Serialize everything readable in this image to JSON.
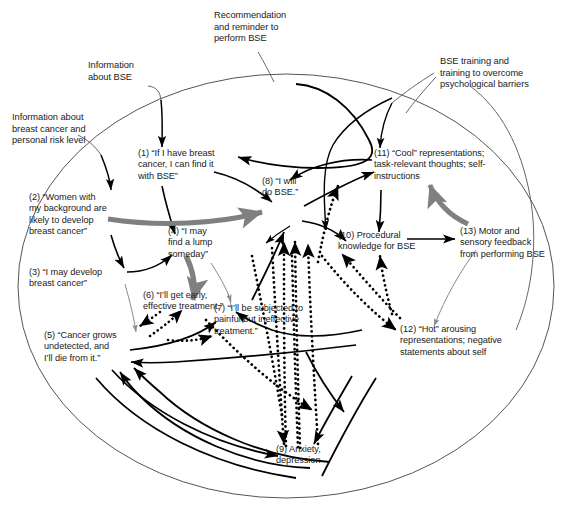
{
  "figure": {
    "boundary_shape": "ellipse",
    "colors": {
      "text": "#1a1a1a",
      "solid_arrow": "#000000",
      "dotted_arrow": "#000000",
      "gray_arrow": "#808080",
      "thin_gray_arrow": "#8a8a8a",
      "boundary": "#555555",
      "background": "#ffffff"
    },
    "legend_note": "Solid black arrows, thick gray arrows, thin gray arrows, and dotted black arrows denote different link types"
  },
  "external_inputs": [
    {
      "id": "ext-information-about-bse",
      "text": "Information\nabout BSE"
    },
    {
      "id": "ext-recommendation-reminder",
      "text": "Recommendation\nand reminder to\nperform BSE"
    },
    {
      "id": "ext-information-breast-cancer-risk",
      "text": "Information about\nbreast cancer and\npersonal risk level"
    },
    {
      "id": "ext-bse-training",
      "text": "BSE training and\ntraining to overcome\npsychological barriers"
    }
  ],
  "nodes": [
    {
      "id": "node-1",
      "number": "(1)",
      "text": "(1) “If I have breast\ncancer, I can find it\nwith BSE”"
    },
    {
      "id": "node-2",
      "number": "(2)",
      "text": "(2) “Women with\nmy background are\nlikely to develop\nbreast cancer”"
    },
    {
      "id": "node-3",
      "number": "(3)",
      "text": "(3) “I may develop\nbreast cancer”"
    },
    {
      "id": "node-4",
      "number": "(4)",
      "text": "(4) “I may\nfind a lump\nsomeday”"
    },
    {
      "id": "node-5",
      "number": "(5)",
      "text": "(5) “Cancer grows\nundetected, and\nI’ll die from it.”"
    },
    {
      "id": "node-6",
      "number": "(6)",
      "text": "(6) “I’ll get early,\neffective treatment.”"
    },
    {
      "id": "node-7",
      "number": "(7)",
      "text": "(7) “I’ll be subjected to\npainful but ineffective\ntreatment.”"
    },
    {
      "id": "node-8",
      "number": "(8)",
      "text": "(8) “I will\ndo BSE.”"
    },
    {
      "id": "node-9",
      "number": "(9)",
      "text": "(9) Anxiety,\ndepression"
    },
    {
      "id": "node-10",
      "number": "(10)",
      "text": "(10) Procedural\nknowledge for BSE"
    },
    {
      "id": "node-11",
      "number": "(11)",
      "text": "(11) “Cool” representations;\ntask-relevant thoughts; self-\ninstructions"
    },
    {
      "id": "node-12",
      "number": "(12)",
      "text": "(12) “Hot” arousing\nrepresentations; negative\nstatements about self"
    },
    {
      "id": "node-13",
      "number": "(13)",
      "text": "(13) Motor and\nsensory feedback\nfrom performing BSE"
    }
  ]
}
